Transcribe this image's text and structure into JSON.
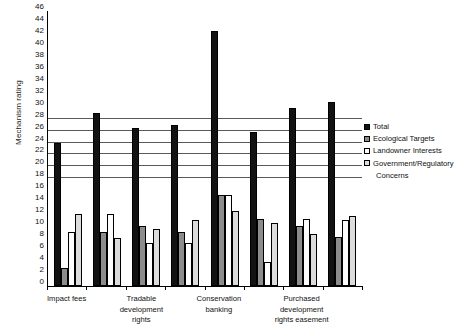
{
  "chart_data": {
    "type": "bar",
    "title": "",
    "xlabel": "",
    "ylabel": "Mechanism rating",
    "ylim": [
      0,
      46
    ],
    "ytick_step": 2,
    "yticks": [
      46,
      44,
      42,
      40,
      38,
      36,
      34,
      32,
      30,
      28,
      26,
      24,
      22,
      20,
      18,
      16,
      14,
      12,
      10,
      8,
      6,
      4,
      2,
      0
    ],
    "grid": true,
    "grid_values": [
      28,
      26,
      24,
      22,
      20,
      18
    ],
    "legend_position": "right",
    "categories": [
      "Impact fees",
      "",
      "Tradable development rights",
      "",
      "Conservation banking",
      "",
      "Purchased development rights easement",
      ""
    ],
    "visible_category_labels": [
      {
        "index": 0,
        "lines": [
          "Impact fees"
        ]
      },
      {
        "index": 2,
        "lines": [
          "Tradable",
          "development",
          "rights"
        ]
      },
      {
        "index": 4,
        "lines": [
          "Conservation",
          "banking"
        ]
      },
      {
        "index": 6,
        "lines": [
          "Purchased",
          "development",
          "rights easement"
        ]
      }
    ],
    "series": [
      {
        "name": "Total",
        "color": "#121212",
        "values": [
          24,
          29,
          26.5,
          27,
          42.7,
          25.7,
          29.7,
          30.7
        ]
      },
      {
        "name": "Ecological Targets",
        "color": "#8c8c8c",
        "values": [
          3,
          9,
          10.1,
          9.1,
          15.2,
          11.2,
          10.1,
          8.2
        ]
      },
      {
        "name": "Landowner Interests",
        "color": "#fdfdfd",
        "values": [
          9,
          12,
          7.2,
          7.2,
          15.3,
          4.1,
          11.2,
          11.1
        ]
      },
      {
        "name": "Government/Regulatory Concerns",
        "color": "#dcdcdc",
        "values": [
          12,
          8,
          9.6,
          11.1,
          12.5,
          10.6,
          8.7,
          11.7
        ]
      }
    ]
  },
  "legend": {
    "items": [
      {
        "label": "Total",
        "swatch": "#121212"
      },
      {
        "label": "Ecological Targets",
        "swatch": "#8c8c8c"
      },
      {
        "label": "Landowner Interests",
        "swatch": "#fdfdfd"
      },
      {
        "label": "Government/Regulatory",
        "swatch": "#dcdcdc"
      }
    ],
    "continuation": "Concerns"
  }
}
